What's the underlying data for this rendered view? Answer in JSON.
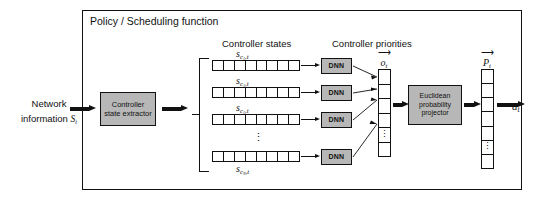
{
  "diagram": {
    "frame_title": "Policy / Scheduling function",
    "input": {
      "line1": "Network",
      "line2": "information",
      "symbol": "S",
      "symbol_sub": "t"
    },
    "extractor_box": {
      "line1": "Controller",
      "line2": "state extractor"
    },
    "headers": {
      "controller_states": "Controller states",
      "controller_priorities": "Controller priorities"
    },
    "state_rows": [
      {
        "symbol": "s",
        "sub": "c",
        "subsub": "1",
        "sub_tail": ",t",
        "cells": 8,
        "dnn_label": "DNN"
      },
      {
        "symbol": "s",
        "sub": "c",
        "subsub": "1",
        "sub_tail": ",t",
        "cells": 8,
        "dnn_label": "DNN"
      },
      {
        "symbol": "s",
        "sub": "c",
        "subsub": "1",
        "sub_tail": ",t",
        "cells": 8,
        "dnn_label": "DNN"
      },
      {
        "symbol": "s",
        "sub": "c",
        "subsub": "N",
        "sub_tail": ",t",
        "cells": 8,
        "dnn_label": "DNN"
      }
    ],
    "row_ellipsis": "⋮",
    "output_vector": {
      "arrow_glyph": "⟶",
      "symbol": "o",
      "symbol_sub": "t",
      "cells": 5
    },
    "projector_box": {
      "line1": "Euclidean",
      "line2": "probability",
      "line3": "projector"
    },
    "probability_vector": {
      "arrow_glyph": "⟶",
      "symbol": "P",
      "symbol_sub": "t",
      "cells": 6
    },
    "action": {
      "symbol": "a",
      "symbol_sub": "t"
    },
    "colors": {
      "box_fill": "#b7b7b7",
      "stroke": "#111111",
      "background": "#ffffff"
    }
  }
}
